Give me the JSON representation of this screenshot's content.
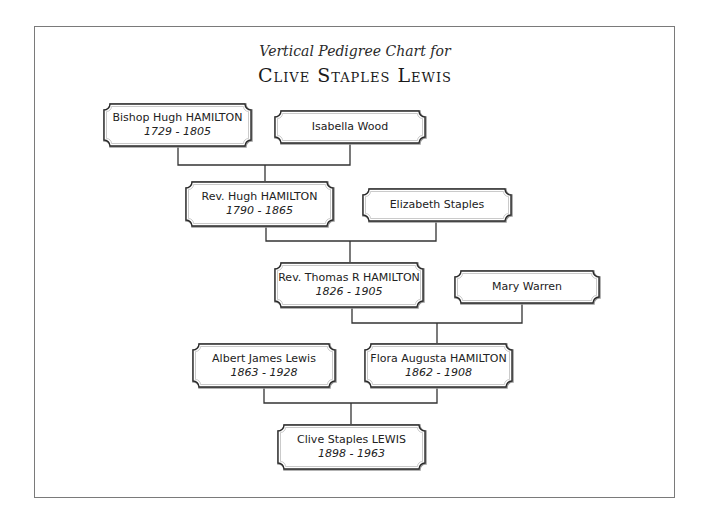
{
  "title": {
    "subtitle": "Vertical Pedigree Chart for",
    "name": "Clive Staples Lewis"
  },
  "colors": {
    "line": "#333333",
    "box_border": "#2a2a2a",
    "box_shadow": "#9a9a9a",
    "frame": "#7a7a7a"
  },
  "people": [
    {
      "id": "bishop-hugh-hamilton",
      "name": "Bishop Hugh HAMILTON",
      "dates": "1729 - 1805",
      "box": [
        103,
        103,
        149,
        44
      ]
    },
    {
      "id": "isabella-wood",
      "name": "Isabella Wood",
      "dates": "",
      "box": [
        274,
        110,
        152,
        34
      ]
    },
    {
      "id": "rev-hugh-hamilton",
      "name": "Rev. Hugh HAMILTON",
      "dates": "1790 - 1865",
      "box": [
        185,
        181,
        149,
        46
      ]
    },
    {
      "id": "elizabeth-staples",
      "name": "Elizabeth Staples",
      "dates": "",
      "box": [
        362,
        188,
        150,
        34
      ]
    },
    {
      "id": "rev-thomas-r-hamilton",
      "name": "Rev. Thomas R HAMILTON",
      "dates": "1826 - 1905",
      "box": [
        274,
        262,
        150,
        46
      ]
    },
    {
      "id": "mary-warren",
      "name": "Mary Warren",
      "dates": "",
      "box": [
        454,
        270,
        146,
        34
      ]
    },
    {
      "id": "albert-james-lewis",
      "name": "Albert James Lewis",
      "dates": "1863 - 1928",
      "box": [
        192,
        343,
        144,
        45
      ]
    },
    {
      "id": "flora-augusta-hamilton",
      "name": "Flora Augusta HAMILTON",
      "dates": "1862 - 1908",
      "box": [
        364,
        343,
        149,
        45
      ]
    },
    {
      "id": "clive-staples-lewis",
      "name": "Clive Staples LEWIS",
      "dates": "1898 - 1963",
      "box": [
        277,
        424,
        149,
        46
      ]
    }
  ],
  "connectors": [
    [
      [
        178,
        147
      ],
      [
        178,
        165
      ],
      [
        350,
        165
      ],
      [
        350,
        144
      ]
    ],
    [
      [
        265,
        165
      ],
      [
        265,
        181
      ]
    ],
    [
      [
        266,
        227
      ],
      [
        266,
        241
      ],
      [
        436,
        241
      ],
      [
        436,
        222
      ]
    ],
    [
      [
        350,
        241
      ],
      [
        350,
        262
      ]
    ],
    [
      [
        352,
        308
      ],
      [
        352,
        323
      ],
      [
        522,
        323
      ],
      [
        522,
        304
      ]
    ],
    [
      [
        437,
        323
      ],
      [
        437,
        343
      ]
    ],
    [
      [
        264,
        388
      ],
      [
        264,
        403
      ],
      [
        437,
        403
      ],
      [
        437,
        388
      ]
    ],
    [
      [
        351,
        403
      ],
      [
        351,
        424
      ]
    ]
  ]
}
